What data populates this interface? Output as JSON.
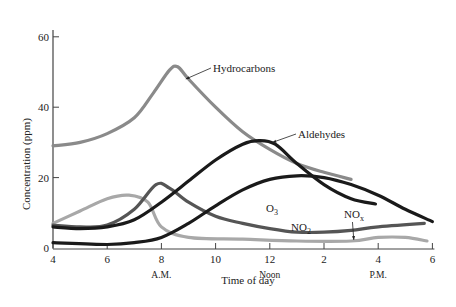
{
  "chart_data": {
    "type": "line",
    "title": "",
    "xlabel": "Time of day",
    "ylabel": "Concentration (ppm)",
    "xlim": [
      4,
      18
    ],
    "ylim": [
      0,
      65
    ],
    "grid": false,
    "x_ticks": [
      {
        "value": 4,
        "label": "4"
      },
      {
        "value": 6,
        "label": "6"
      },
      {
        "value": 8,
        "label": "8"
      },
      {
        "value": 10,
        "label": "10"
      },
      {
        "value": 12,
        "label": "12"
      },
      {
        "value": 14,
        "label": "2"
      },
      {
        "value": 16,
        "label": "4"
      },
      {
        "value": 18,
        "label": "6"
      }
    ],
    "x_sublabels": [
      {
        "value": 8,
        "label": "A.M."
      },
      {
        "value": 12,
        "label": "Noon"
      },
      {
        "value": 16,
        "label": "P.M."
      }
    ],
    "y_ticks": [
      {
        "value": 0,
        "label": "0"
      },
      {
        "value": 20,
        "label": "20"
      },
      {
        "value": 40,
        "label": "40"
      },
      {
        "value": 60,
        "label": "60"
      }
    ],
    "series": [
      {
        "name": "Hydrocarbons",
        "color": "#8a8a8a",
        "points": [
          [
            4,
            29
          ],
          [
            5,
            30
          ],
          [
            6,
            32.5
          ],
          [
            7,
            37
          ],
          [
            7.7,
            44
          ],
          [
            8.3,
            50.5
          ],
          [
            8.6,
            51.5
          ],
          [
            9,
            48
          ],
          [
            10,
            40
          ],
          [
            11,
            33
          ],
          [
            12,
            28
          ],
          [
            13,
            24
          ],
          [
            14,
            21.5
          ],
          [
            15,
            19.5
          ]
        ]
      },
      {
        "name": "Aldehydes",
        "color": "#1a1a1a",
        "points": [
          [
            4,
            6
          ],
          [
            5,
            5.5
          ],
          [
            6,
            6
          ],
          [
            7,
            8
          ],
          [
            8,
            13
          ],
          [
            9,
            19
          ],
          [
            10,
            25
          ],
          [
            11,
            29.5
          ],
          [
            11.6,
            30.5
          ],
          [
            12.2,
            29.5
          ],
          [
            13,
            24
          ],
          [
            14,
            18
          ],
          [
            15,
            14
          ],
          [
            15.9,
            12.5
          ]
        ]
      },
      {
        "name": "O3",
        "color": "#1a1a1a",
        "points": [
          [
            4,
            1.5
          ],
          [
            6,
            1
          ],
          [
            7,
            1.5
          ],
          [
            8,
            3
          ],
          [
            9,
            7
          ],
          [
            10,
            12
          ],
          [
            11,
            16.5
          ],
          [
            12,
            19.5
          ],
          [
            13,
            20.5
          ],
          [
            14,
            20
          ],
          [
            15,
            18
          ],
          [
            16,
            15
          ],
          [
            17,
            11
          ],
          [
            18,
            7.5
          ]
        ]
      },
      {
        "name": "NO2",
        "color": "#555555",
        "points": [
          [
            4,
            6.5
          ],
          [
            5,
            6
          ],
          [
            6,
            6.5
          ],
          [
            7,
            11
          ],
          [
            7.8,
            18
          ],
          [
            8.3,
            17
          ],
          [
            9,
            13
          ],
          [
            10,
            9
          ],
          [
            11,
            7
          ],
          [
            12,
            5.5
          ],
          [
            13,
            4.5
          ],
          [
            14,
            4.5
          ],
          [
            15,
            5
          ],
          [
            16,
            6
          ],
          [
            17.7,
            7
          ]
        ]
      },
      {
        "name": "NO",
        "color": "#a8a8a8",
        "points": [
          [
            4,
            7
          ],
          [
            5,
            10.5
          ],
          [
            6,
            14
          ],
          [
            6.8,
            15
          ],
          [
            7.5,
            13
          ],
          [
            8,
            6
          ],
          [
            9,
            3
          ],
          [
            11,
            2.5
          ],
          [
            13,
            2
          ],
          [
            15,
            2
          ],
          [
            16,
            3
          ],
          [
            17,
            3
          ],
          [
            17.8,
            2
          ]
        ]
      }
    ],
    "annotations": [
      {
        "text": "Hydrocarbons",
        "x": 9.6,
        "y": 50.5,
        "arrow_to": [
          8.9,
          48
        ]
      },
      {
        "text": "Aldehydes",
        "x": 13.1,
        "y": 32.5,
        "arrow_to": [
          12.1,
          30
        ]
      },
      {
        "text": "O3",
        "x": 12.3,
        "y": 11
      },
      {
        "text": "NO2",
        "x": 13.1,
        "y": 6
      },
      {
        "text": "NOx",
        "x": 15.2,
        "y": 9.5,
        "arrow_to": [
          15.1,
          2.3
        ]
      }
    ]
  },
  "labels": {
    "ylabel": "Concentration (ppm)",
    "xlabel": "Time of day",
    "hydrocarbons": "Hydrocarbons",
    "aldehydes": "Aldehydes",
    "o3_main": "O",
    "o3_sub": "3",
    "no2_main": "NO",
    "no2_sub": "2",
    "nox_main": "NO",
    "nox_sub": "x"
  }
}
